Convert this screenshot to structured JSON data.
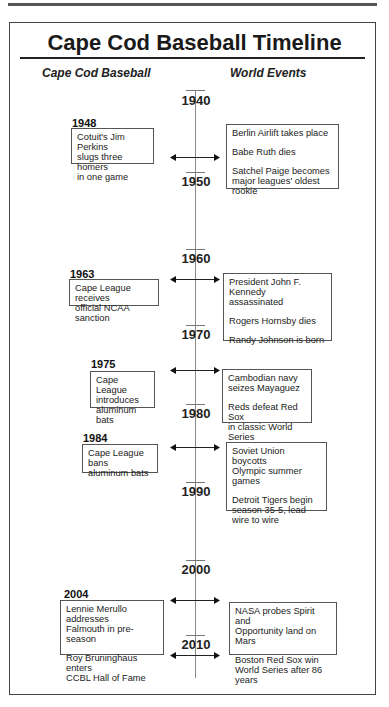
{
  "title": "Cape Cod Baseball Timeline",
  "columns": {
    "left": "Cape Cod Baseball",
    "right": "World Events"
  },
  "decades": [
    "1940",
    "1950",
    "1960",
    "1970",
    "1980",
    "1990",
    "2000",
    "2010"
  ],
  "events": [
    {
      "year": "1948",
      "cape_cod": [
        "Cotuit's Jim Perkins\nslugs three homers\n in one game"
      ],
      "world": [
        "Berlin Airlift takes place",
        "Babe Ruth dies",
        "Satchel Paige becomes\nmajor leagues' oldest rookie"
      ]
    },
    {
      "year": "1963",
      "cape_cod": [
        "Cape League receives\nofficial NCAA sanction"
      ],
      "world": [
        "President John F. Kennedy\nassassinated",
        "Rogers Hornsby dies",
        "Randy Johnson is born"
      ]
    },
    {
      "year": "1975",
      "cape_cod": [
        "Cape League\nintroduces\naluminum bats"
      ],
      "world": [
        "Cambodian navy\nseizes Mayaguez",
        "Reds defeat Red Sox\nin classic World Series"
      ]
    },
    {
      "year": "1984",
      "cape_cod": [
        "Cape League bans\naluminum bats"
      ],
      "world": [
        "Soviet Union boycotts\nOlympic summer games",
        "Detroit Tigers begin\nseason 35-5, lead\nwire to wire"
      ]
    },
    {
      "year": "2004",
      "cape_cod": [
        "Lennie Merullo addresses\nFalmouth in pre-season",
        "Roy Bruninghaus enters\nCCBL Hall of Fame"
      ],
      "world": [
        "NASA probes Spirit and\nOpportunity land on Mars",
        "Boston Red Sox win\nWorld Series after 86 years"
      ]
    }
  ]
}
